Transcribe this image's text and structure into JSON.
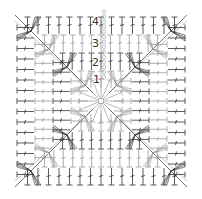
{
  "diagram": {
    "type": "crochet-chart-square",
    "title": "",
    "round_labels": [
      "1",
      "2",
      "3",
      "4"
    ],
    "colors": {
      "background": "#ffffff",
      "stitch_dark": "#333333",
      "stitch_light": "#9a9a9a",
      "label": "#333333"
    },
    "center": {
      "x": 101,
      "y": 101
    },
    "square": {
      "left": 14,
      "top": 10,
      "right": 190,
      "bottom": 186
    },
    "rounds": 4
  }
}
